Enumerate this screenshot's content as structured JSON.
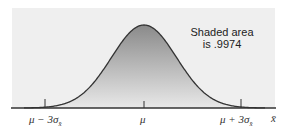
{
  "chart_data": {
    "type": "area",
    "title": "",
    "annotation": [
      "Shaded area",
      "is .9974"
    ],
    "shaded_area": 0.9974,
    "x_ticks": [
      "μ − 3σ",
      "μ",
      "μ + 3σ"
    ],
    "x_tick_subscript": "x̄",
    "xlabel": "x̄",
    "ylabel": "",
    "shaded_range": [
      "μ − 3σx̄",
      "μ + 3σx̄"
    ],
    "grid": false,
    "legend": false
  },
  "colors": {
    "panel_bg": "#ededed",
    "shade_top": "#8a8a8a",
    "shade_bottom": "#e6e6e6",
    "curve": "#333333",
    "axis": "#333333"
  }
}
